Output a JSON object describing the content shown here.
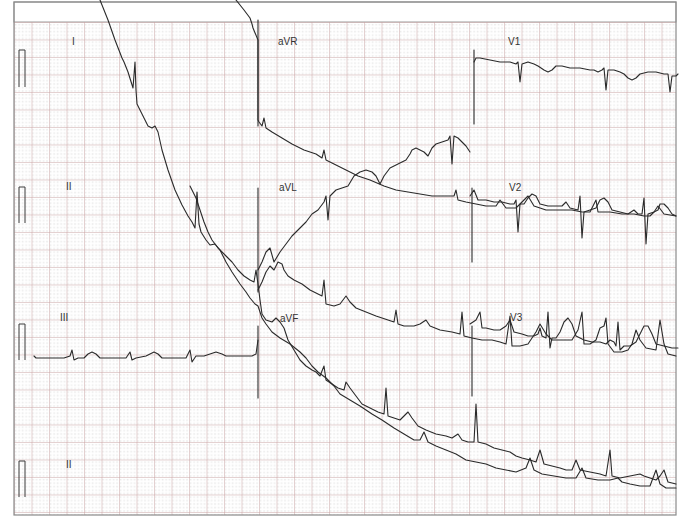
{
  "chart_data": {
    "type": "line",
    "grid": {
      "on": true,
      "major_color": "#c9a3a3",
      "minor_dot_color": "#b9b9b9",
      "major_spacing_px": 17.5,
      "frame": {
        "x": 14,
        "y": 2,
        "w": 662,
        "h": 513,
        "grid_top": 22
      }
    },
    "leads": [
      {
        "name": "I",
        "label_x": 72,
        "label_y": 45
      },
      {
        "name": "aVR",
        "label_x": 278,
        "label_y": 45
      },
      {
        "name": "V1",
        "label_x": 508,
        "label_y": 45
      },
      {
        "name": "II",
        "label_x": 66,
        "label_y": 190
      },
      {
        "name": "aVL",
        "label_x": 279,
        "label_y": 191
      },
      {
        "name": "V2",
        "label_x": 509,
        "label_y": 191
      },
      {
        "name": "III",
        "label_x": 60,
        "label_y": 321
      },
      {
        "name": "aVF",
        "label_x": 280,
        "label_y": 322
      },
      {
        "name": "V3",
        "label_x": 510,
        "label_y": 321
      },
      {
        "name": "II",
        "label_x": 66,
        "label_y": 468
      }
    ],
    "calibration_pulses": [
      {
        "x": 31,
        "top": 50,
        "bottom": 87
      },
      {
        "x": 31,
        "top": 187,
        "bottom": 223
      },
      {
        "x": 31,
        "top": 324,
        "bottom": 360
      },
      {
        "x": 31,
        "top": 461,
        "bottom": 497
      }
    ],
    "traces": [
      {
        "lead": "I (wandering baseline)",
        "points": "100,0 108,20 115,40 122,58 124,62 128,72 133,88 135,62 136,90 137,104 142,114 148,126 152,128 155,126 158,132 162,150 168,170 175,190 182,205 188,216 192,222 195,228 197,192 199,224 201,232 206,240 210,245 215,244 220,250 226,262 232,272 240,284 246,292 250,298 255,304 258,306 260,312 262,318 266,324 272,332 280,338 290,344 300,352 306,358 312,366 318,372 326,378 334,386 340,394 350,400 360,406 372,414 382,420 394,428 404,434 414,440 420,440 424,432 428,442 436,446 446,450 456,454 466,460 476,462 486,464 496,468 506,470 516,472 526,468 530,458 534,470 542,474 554,476 566,478 576,478 582,468 586,478 598,480 610,480 618,478 622,482 630,484 640,486 650,486 656,470 660,484 666,488 676,488"
      },
      {
        "lead": "aVR (wandering baseline)",
        "points": "236,0 244,10 250,18 252,24 253,28 258,40 258,120 259,122 262,126 264,118 266,128 272,132 282,138 292,144 304,150 316,154 322,158 324,150 326,160 334,164 346,170 358,176 370,180 384,186 396,190 408,192 420,194 432,196 444,196 454,196 456,190 458,200 466,202 476,204 486,206 496,206 500,200 506,208 516,208 522,202 528,196 534,206 546,210 560,210 572,210 582,212 590,212 596,200 598,212 610,212 622,214 634,214 644,216 650,216 654,212 658,206 664,214 676,216"
      },
      {
        "lead": "aVL (rising baseline)",
        "points": "258,270 262,262 266,252 270,248 274,262 280,252 286,244 292,236 300,228 306,222 312,214 318,210 324,202 326,196 328,220 330,196 336,190 342,188 348,186 354,176 360,172 366,170 372,172 376,176 380,184 384,176 390,168 398,164 406,160 410,154 412,150 416,148 420,150 424,152 428,156 432,148 436,144 442,142 448,140 450,136 452,164 454,136 458,138 462,142 466,146 470,152"
      },
      {
        "lead": "II / aVF (wandering baseline)",
        "points": "190,186 196,198 200,210 204,222 208,232 212,240 218,248 226,256 232,262 238,270 244,276 250,280 254,282 256,270 258,284 260,300 262,314 266,320 272,322 276,318 280,322 284,328 288,340 294,350 300,360 306,366 312,370 316,372 320,376 324,366 326,380 332,384 338,388 344,390 346,382 350,388 356,396 362,404 370,408 378,412 384,414 386,388 388,416 394,418 400,420 404,416 408,412 412,418 418,426 426,430 436,434 446,436 452,438 458,434 462,440 468,442 474,442 476,404 478,442 486,444 494,448 502,450 510,452 516,456 522,458 530,460 536,462 540,450 544,464 552,466 560,468 566,470 572,470 576,460 580,470 590,472 600,474 606,476 610,450 612,476 620,478 630,476 640,474 644,476 650,478 656,480 660,476 664,470 668,482 676,484"
      },
      {
        "lead": "aVL/II lower crossing",
        "points": "258,290 262,282 266,272 270,266 274,270 278,262 282,264 284,270 288,276 294,280 302,284 310,290 318,294 322,296 324,280 326,304 334,306 340,304 346,296 350,302 356,308 366,312 376,316 388,320 394,322 396,310 398,324 404,326 414,326 420,324 426,320 430,326 440,330 452,332 460,334 462,312 464,336 472,338 482,340 492,340 500,342 506,344 510,316 512,346 520,346 528,344 536,332 540,324 546,334 552,340 560,340 572,340 578,330 582,312 584,344 590,344 596,340 600,328 604,326 606,318 608,344 614,352 622,352 628,350 632,344 636,330 640,340 646,348 656,350 660,320 664,344 668,354 676,356"
      },
      {
        "lead": "V1",
        "points": "474,62 476,58 480,58 490,60 500,62 510,62 516,64 518,62 520,82 522,64 528,62 534,64 538,66 544,70 548,72 552,70 556,66 562,66 570,68 580,68 590,70 594,70 598,72 602,70 604,68 606,90 608,70 614,70 620,72 624,74 628,78 632,80 636,78 640,74 648,72 656,72 664,74 668,74 670,92 672,76 676,76 678,74"
      },
      {
        "lead": "V2",
        "points": "470,196 474,190 478,200 486,200 494,202 502,202 510,204 514,204 516,200 518,232 520,204 524,204 528,198 532,194 536,196 540,204 548,206 556,206 562,206 566,202 570,208 578,210 580,196 582,238 584,212 590,210 596,208 600,200 604,198 608,202 612,210 620,212 628,214 634,210 638,214 642,214 644,198 646,244 648,214 654,212 658,210 660,204 664,204 668,208 672,214 676,216"
      },
      {
        "lead": "III",
        "points": "34,356 36,358 44,358 54,358 64,358 70,356 72,350 74,360 78,358 84,358 88,354 92,352 96,354 100,358 110,358 120,358 126,358 130,352 132,360 136,358 146,356 150,354 154,352 158,354 162,358 170,358 180,358 186,358 190,350 192,362 196,356 204,356 210,354 216,352 222,354 226,356 234,356 244,356 252,356 256,354 258,340"
      },
      {
        "lead": "V3",
        "points": "470,324 476,320 480,312 482,328 486,328 494,330 500,330 506,326 510,320 514,332 522,334 528,336 534,336 538,334 540,328 542,336 546,338 548,312 550,348 552,338 556,338 560,332 564,322 568,318 572,324 576,336 584,340 592,342 600,342 606,344 610,340 614,342 616,346 618,322 620,350 624,346 630,346 636,342 640,334 644,326 648,326 652,334 656,344 664,346 672,348 678,348"
      }
    ],
    "deep_s_waves": [
      {
        "x": 258,
        "top": 20,
        "bottom": 126
      },
      {
        "x": 474,
        "top": 50,
        "bottom": 124
      },
      {
        "x": 258,
        "top": 188,
        "bottom": 292
      },
      {
        "x": 472,
        "top": 188,
        "bottom": 262
      },
      {
        "x": 258,
        "top": 326,
        "bottom": 398
      },
      {
        "x": 472,
        "top": 326,
        "bottom": 396
      }
    ]
  }
}
